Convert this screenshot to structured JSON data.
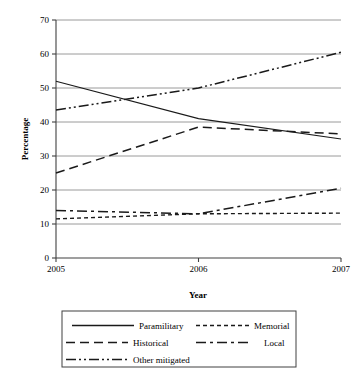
{
  "chart_data": {
    "type": "line",
    "title": "",
    "xlabel": "Year",
    "ylabel": "Percentage",
    "x": [
      2005,
      2006,
      2007
    ],
    "categories": [
      "2005",
      "2006",
      "2007"
    ],
    "xtick_labels": [
      "2005",
      "2006",
      "2007"
    ],
    "ytick_labels": [
      "0",
      "10",
      "20",
      "30",
      "40",
      "50",
      "60",
      "70"
    ],
    "yticks": [
      0,
      10,
      20,
      30,
      40,
      50,
      60,
      70
    ],
    "ylim": [
      0,
      70
    ],
    "xlim": [
      2005,
      2007
    ],
    "grid": "horizontal",
    "legend_position": "bottom",
    "series": [
      {
        "name": "Paramilitary",
        "values": [
          52,
          41,
          35
        ],
        "style": "solid",
        "dash": "none",
        "color": "#1a1a1a",
        "width": 1.1
      },
      {
        "name": "Memorial",
        "values": [
          11.5,
          13,
          13.2
        ],
        "style": "dotted-dash",
        "dash": "4,3",
        "color": "#1a1a1a",
        "width": 1.4
      },
      {
        "name": "Historical",
        "values": [
          25,
          38.5,
          36.5
        ],
        "style": "dashed",
        "dash": "9,5",
        "color": "#1a1a1a",
        "width": 1.5
      },
      {
        "name": "Local",
        "values": [
          14,
          13,
          20.5
        ],
        "style": "dash-dot",
        "dash": "10,4,3,4",
        "color": "#1a1a1a",
        "width": 1.5
      },
      {
        "name": "Other mitigated",
        "values": [
          43.5,
          50,
          60.5
        ],
        "style": "dash-dot-dot",
        "dash": "10,3,2,3,2,3",
        "color": "#1a1a1a",
        "width": 1.5
      }
    ]
  },
  "legend": {
    "entries": [
      {
        "label": "Paramilitary",
        "dash": "none"
      },
      {
        "label": "Memorial",
        "dash": "4,3"
      },
      {
        "label": "Historical",
        "dash": "9,5"
      },
      {
        "label": "Local",
        "dash": "10,4,3,4"
      },
      {
        "label": "Other mitigated",
        "dash": "10,3,2,3,2,3"
      }
    ]
  }
}
